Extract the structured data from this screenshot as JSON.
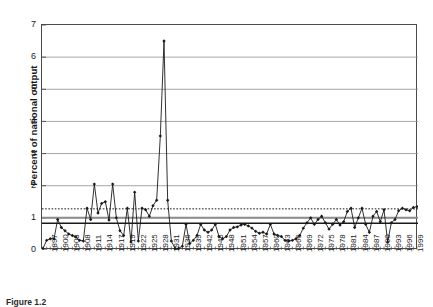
{
  "figure": {
    "caption": "Figure 1.2"
  },
  "chart_data": {
    "type": "line",
    "title": "",
    "xlabel": "",
    "ylabel": "Percent of national output",
    "ylim": [
      0,
      7
    ],
    "yticks": [
      0,
      1,
      2,
      3,
      4,
      5,
      6,
      7
    ],
    "xlim": [
      1897,
      1999
    ],
    "grid": "horizontal",
    "legend": "none",
    "marker": "diamond",
    "tick_labels_rotated": true,
    "xtick_labels": [
      "1897",
      "1900",
      "1903",
      "1908",
      "1911",
      "1914",
      "1917",
      "1919",
      "1922",
      "1925",
      "1928",
      "1931",
      "1936",
      "1939",
      "1942",
      "1945",
      "1948",
      "1951",
      "1954",
      "1957",
      "1960",
      "1963",
      "1966",
      "1969",
      "1972",
      "1975",
      "1978",
      "1981",
      "1984",
      "1987",
      "1990",
      "1993",
      "1996",
      "1999"
    ],
    "reference_lines": [
      {
        "name": "dotted-reference-line",
        "value": 1.28,
        "style": "dotted",
        "color": "#1a1a1a",
        "width": 1
      },
      {
        "name": "gray-reference-line",
        "value": 1.0,
        "style": "solid",
        "color": "#8c8c8c",
        "width": 2
      },
      {
        "name": "solid-reference-line",
        "value": 0.83,
        "style": "solid",
        "color": "#1a1a1a",
        "width": 1.4
      }
    ],
    "series": [
      {
        "name": "Percent of national output",
        "color": "#1a1a1a",
        "x": [
          1897,
          1898,
          1899,
          1900,
          1901,
          1902,
          1903,
          1904,
          1905,
          1906,
          1907,
          1908,
          1909,
          1910,
          1911,
          1912,
          1913,
          1914,
          1915,
          1916,
          1917,
          1918,
          1919,
          1920,
          1921,
          1922,
          1923,
          1924,
          1925,
          1926,
          1927,
          1928,
          1929,
          1930,
          1931,
          1932,
          1933,
          1934,
          1935,
          1936,
          1937,
          1938,
          1939,
          1940,
          1941,
          1942,
          1943,
          1944,
          1945,
          1946,
          1947,
          1948,
          1949,
          1950,
          1951,
          1952,
          1953,
          1954,
          1955,
          1956,
          1957,
          1958,
          1959,
          1960,
          1961,
          1962,
          1963,
          1964,
          1965,
          1966,
          1967,
          1968,
          1969,
          1970,
          1971,
          1972,
          1973,
          1974,
          1975,
          1976,
          1977,
          1978,
          1979,
          1980,
          1981,
          1982,
          1983,
          1984,
          1985,
          1986,
          1987,
          1988,
          1989,
          1990,
          1991,
          1992,
          1993,
          1994,
          1995,
          1996,
          1997,
          1998,
          1999
        ],
        "values": [
          0.05,
          0.3,
          0.35,
          0.35,
          0.95,
          0.7,
          0.6,
          0.5,
          0.45,
          0.4,
          0.3,
          0.28,
          1.3,
          0.95,
          2.05,
          1.15,
          1.45,
          1.5,
          0.93,
          2.05,
          1.0,
          0.6,
          0.45,
          1.3,
          0.25,
          1.8,
          0.28,
          1.3,
          1.25,
          1.05,
          1.38,
          1.55,
          3.55,
          6.5,
          1.55,
          0.28,
          0.05,
          0.05,
          0.12,
          0.8,
          0.2,
          0.3,
          0.45,
          0.8,
          0.62,
          0.55,
          0.62,
          0.8,
          0.42,
          0.35,
          0.42,
          0.62,
          0.7,
          0.72,
          0.78,
          0.8,
          0.75,
          0.68,
          0.58,
          0.52,
          0.55,
          0.5,
          0.8,
          0.5,
          0.45,
          0.42,
          0.3,
          0.28,
          0.3,
          0.35,
          0.45,
          0.68,
          0.85,
          1.0,
          0.8,
          0.95,
          1.05,
          0.85,
          0.65,
          0.8,
          0.95,
          0.78,
          0.88,
          1.2,
          1.3,
          0.7,
          1.0,
          1.3,
          0.8,
          0.55,
          1.05,
          1.2,
          0.88,
          1.25,
          0.25,
          0.85,
          0.95,
          1.22,
          1.3,
          1.25,
          1.22,
          1.32,
          1.35
        ]
      }
    ]
  }
}
